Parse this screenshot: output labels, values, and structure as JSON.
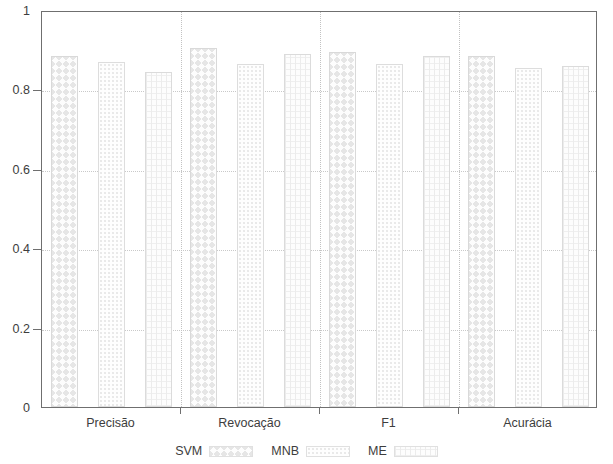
{
  "chart_data": {
    "type": "bar",
    "title": "",
    "subtitle": "",
    "xlabel": "",
    "ylabel": "",
    "categories": [
      "Precisão",
      "Revocação",
      "F1",
      "Acurácia"
    ],
    "series": [
      {
        "name": "SVM",
        "values": [
          0.885,
          0.905,
          0.895,
          0.885
        ]
      },
      {
        "name": "MNB",
        "values": [
          0.87,
          0.865,
          0.865,
          0.855
        ]
      },
      {
        "name": "ME",
        "values": [
          0.845,
          0.89,
          0.885,
          0.86
        ]
      }
    ],
    "ylim": [
      0,
      1
    ],
    "yticks": [
      0,
      0.2,
      0.4,
      0.6,
      0.8,
      1
    ],
    "ytick_labels": [
      "0",
      "0.2",
      "0.4",
      "0.6",
      "0.8",
      "1"
    ],
    "grid": true,
    "grid_axis": "y",
    "grid_style": "dotted",
    "legend_position": "bottom",
    "legend_entries": [
      "SVM",
      "MNB",
      "ME"
    ],
    "bar_style": "grouped-pattern-fill",
    "colors": {
      "axis": "#6f6f6f",
      "text": "#3d3d3d",
      "grid": "#c9c9c9",
      "series_svm": "#e6e6e6",
      "series_mnb": "#e8e8e8",
      "series_me": "#ececec",
      "background": "#ffffff"
    }
  }
}
